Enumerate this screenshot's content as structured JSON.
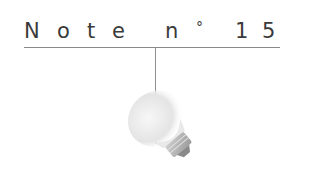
{
  "title": {
    "text": "Note n° 15",
    "chars": [
      "N",
      "o",
      "t",
      "e",
      "n",
      "°",
      "1",
      "5"
    ]
  },
  "illustration": {
    "subject": "lightbulb-icon",
    "color": "#e6e6e6"
  },
  "colors": {
    "text": "#3a3a3a",
    "rule": "#8a8a8a",
    "background": "#ffffff"
  }
}
